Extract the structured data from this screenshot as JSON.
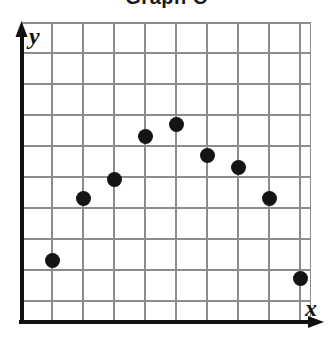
{
  "chart_data": {
    "type": "scatter",
    "title": "Graph C",
    "xlabel": "x",
    "ylabel": "y",
    "grid": true,
    "legend": false,
    "xlim": [
      0,
      9.35
    ],
    "ylim": [
      0,
      9.7
    ],
    "xticks": [
      1,
      2,
      3,
      4,
      5,
      6,
      7,
      8,
      9
    ],
    "yticks": [
      1,
      2,
      3,
      4,
      5,
      6,
      7,
      8,
      9
    ],
    "xtick_labels": [],
    "ytick_labels": [],
    "x": [
      1,
      2,
      3,
      4,
      5,
      6,
      7,
      8,
      9
    ],
    "y": [
      2,
      4,
      4.6,
      6,
      6.4,
      5.4,
      5,
      4,
      1.4
    ],
    "points": [
      {
        "x": 1,
        "y": 2
      },
      {
        "x": 2,
        "y": 4
      },
      {
        "x": 3,
        "y": 4.6
      },
      {
        "x": 4,
        "y": 6
      },
      {
        "x": 5,
        "y": 6.4
      },
      {
        "x": 6,
        "y": 5.4
      },
      {
        "x": 7,
        "y": 5
      },
      {
        "x": 8,
        "y": 4
      },
      {
        "x": 9,
        "y": 1.4
      }
    ],
    "marker": "filled-circle",
    "marker_color": "#141414",
    "grid_color": "#8c8c8c",
    "axis_color": "#111111",
    "background": "#ffffff",
    "annotations": []
  },
  "axes": {
    "y_label": "y",
    "x_label": "x"
  },
  "icons": {
    "y_arrow": "arrow-up-icon",
    "x_arrow": "arrow-right-icon"
  }
}
